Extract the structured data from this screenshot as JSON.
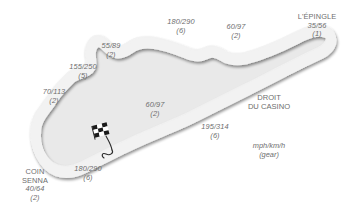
{
  "colors": {
    "background": "#ffffff",
    "track_fill": "#e8e8e8",
    "track_edge": "#6b6b6b",
    "track_shadow": "#cfcfcf",
    "label_text": "#6e6e6e",
    "flag_dark": "#1a1a1a",
    "flag_light": "#ffffff"
  },
  "legend": {
    "units": "mph/km/h",
    "gear_note": "(gear)"
  },
  "straights": [
    {
      "id": "droit-du-casino",
      "line1": "DROIT",
      "line2": "DU CASINO"
    }
  ],
  "corners": [
    {
      "id": "l-epingle",
      "name": "L'ÉPINGLE",
      "speed": "35/56",
      "gear": "(1)"
    },
    {
      "id": "corner-60-97-top",
      "name": "",
      "speed": "60/97",
      "gear": "(2)"
    },
    {
      "id": "corner-180-290-top",
      "name": "",
      "speed": "180/290",
      "gear": "(6)"
    },
    {
      "id": "corner-55-89",
      "name": "",
      "speed": "55/89",
      "gear": "(2)"
    },
    {
      "id": "corner-155-250",
      "name": "",
      "speed": "155/250",
      "gear": "(5)"
    },
    {
      "id": "corner-70-113",
      "name": "",
      "speed": "70/113",
      "gear": "(2)"
    },
    {
      "id": "coin-senna",
      "name_line1": "COIN",
      "name_line2": "SENNA",
      "speed": "40/64",
      "gear": "(2)"
    },
    {
      "id": "corner-180-290-bottom",
      "name": "",
      "speed": "180/290",
      "gear": "(6)"
    },
    {
      "id": "corner-60-97-mid",
      "name": "",
      "speed": "60/97",
      "gear": "(2)"
    },
    {
      "id": "corner-195-314",
      "name": "",
      "speed": "195/314",
      "gear": "(6)"
    }
  ],
  "markers": [
    {
      "id": "start-finish",
      "icon": "checkered-flag-icon"
    }
  ]
}
